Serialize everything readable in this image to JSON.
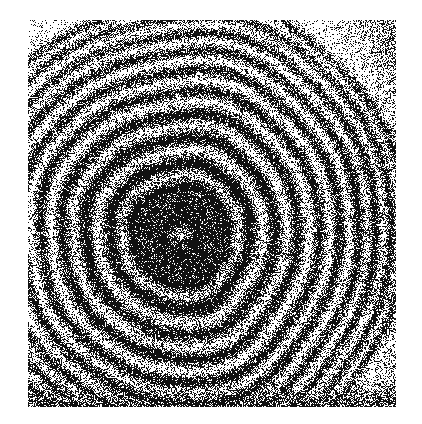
{
  "document": {
    "kind": "scientific-figure",
    "title": "Newton's rings interferogram",
    "caption": "",
    "medium": "halftone / dithered bitonal photographic reproduction",
    "rendered_text": []
  },
  "canvas": {
    "width": 422,
    "height": 424,
    "background_color": "#ffffff",
    "ink_color": "#111111"
  },
  "plate": {
    "name": "photographic-plate",
    "x": 28,
    "y": 20,
    "width": 368,
    "height": 387,
    "border": "none",
    "margin_color": "#ffffff"
  },
  "chart_data": {
    "type": "heatmap",
    "title": "Newton's rings interferogram",
    "subtitle": "",
    "xlabel": "",
    "ylabel": "",
    "legend": [],
    "annotations": [],
    "grid": false,
    "pattern": "concentric-circular-fringes",
    "rendering": "random-dither-halftone",
    "center": {
      "x": 180,
      "y": 235
    },
    "center_in_plate": {
      "x": 152,
      "y": 215
    },
    "core": {
      "description": "dark saturated central disc (zero-order maximum region)",
      "radius": 46,
      "inner_speck_radius": 14
    },
    "ring_count_visible": 10,
    "ring_radii": [
      46,
      70,
      95,
      118,
      140,
      160,
      179,
      196,
      212,
      226
    ],
    "ring_intensity": [
      1.0,
      0.96,
      0.93,
      0.9,
      0.87,
      0.84,
      0.8,
      0.76,
      0.72,
      0.66
    ],
    "ring_thickness": [
      13,
      11,
      10,
      9,
      8,
      7.5,
      7,
      6.5,
      6,
      6
    ],
    "fringe_period_trend": "monotonically decreasing with radius (r ~ sqrt(n))",
    "ellipticity": {
      "x_scale": 1.0,
      "y_scale": 1.04
    },
    "pattern_outer_radius": 232,
    "background": {
      "description": "sparse random dither speckle outside the fringe envelope",
      "density_corner": 0.17,
      "density_near_edge": 0.3
    },
    "bottom_band": {
      "description": "dense dark halftone band along the bottom edge of the plate",
      "y_start": 360,
      "y_end": 387,
      "density": 0.62
    },
    "right_edge_band": {
      "description": "elevated speckle density along the right edge",
      "density": 0.34
    },
    "noise": {
      "type": "bernoulli-threshold-dither",
      "seed": 20250137,
      "grain_px": 1
    }
  },
  "accessibility": {
    "alt_text": "A bitonal halftone photograph of a circular interference pattern: about ten concentric black fringes surround a dense dark core slightly left of centre, fading into random speckle noise toward the edges, with a dark band across the bottom."
  }
}
